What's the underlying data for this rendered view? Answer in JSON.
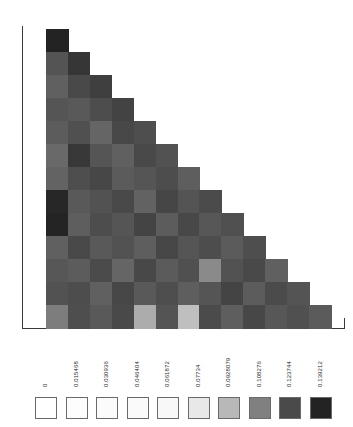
{
  "chart_data": {
    "type": "heatmap",
    "title": "",
    "xlabel": "",
    "ylabel": "",
    "grid": false,
    "shape": "lower-triangular",
    "n_rows": 13,
    "n_cols": 13,
    "legend_position": "bottom",
    "colormap": "grayscale-reversed",
    "value_min": 0,
    "value_max": 0.139212,
    "legend": {
      "labels": [
        "0",
        "0.015468",
        "0.030936",
        "0.046404",
        "0.061872",
        "0.07734",
        "0.0928079",
        "0.108276",
        "0.123744",
        "0.139212"
      ],
      "values": [
        0,
        0.015468,
        0.030936,
        0.046404,
        0.061872,
        0.07734,
        0.0928079,
        0.108276,
        0.123744,
        0.139212
      ],
      "colors": [
        "#ffffff",
        "#fdfdfd",
        "#fbfbfb",
        "#fafafa",
        "#f8f8f8",
        "#e8e8e8",
        "#b8b8b8",
        "#808080",
        "#4a4a4a",
        "#232323"
      ]
    },
    "rows": [
      {
        "row": 0,
        "values": [
          0.1393
        ]
      },
      {
        "row": 1,
        "values": [
          0.121,
          0.1315
        ]
      },
      {
        "row": 2,
        "values": [
          0.1175,
          0.124,
          0.128
        ]
      },
      {
        "row": 3,
        "values": [
          0.1205,
          0.1195,
          0.123,
          0.1265
        ]
      },
      {
        "row": 4,
        "values": [
          0.1185,
          0.122,
          0.116,
          0.1245,
          0.1225
        ]
      },
      {
        "row": 5,
        "values": [
          0.115,
          0.131,
          0.1205,
          0.1175,
          0.124,
          0.1215
        ]
      },
      {
        "row": 6,
        "values": [
          0.1165,
          0.1225,
          0.125,
          0.119,
          0.1205,
          0.123,
          0.118
        ]
      },
      {
        "row": 7,
        "values": [
          0.1375,
          0.1195,
          0.1215,
          0.124,
          0.117,
          0.1255,
          0.121,
          0.1235
        ]
      },
      {
        "row": 8,
        "values": [
          0.1388,
          0.118,
          0.123,
          0.1205,
          0.126,
          0.1185,
          0.1245,
          0.12,
          0.122
        ]
      },
      {
        "row": 9,
        "values": [
          0.1175,
          0.124,
          0.1195,
          0.1215,
          0.118,
          0.125,
          0.1205,
          0.123,
          0.119,
          0.1225
        ]
      },
      {
        "row": 10,
        "values": [
          0.12,
          0.1185,
          0.1235,
          0.116,
          0.1245,
          0.119,
          0.122,
          0.1055,
          0.1215,
          0.124,
          0.1175
        ]
      },
      {
        "row": 11,
        "values": [
          0.1215,
          0.123,
          0.1175,
          0.125,
          0.1195,
          0.1225,
          0.118,
          0.1205,
          0.126,
          0.1185,
          0.1235,
          0.121
        ]
      },
      {
        "row": 12,
        "values": [
          0.109,
          0.1225,
          0.1195,
          0.124,
          0.096,
          0.121,
          0.0905,
          0.1235,
          0.118,
          0.125,
          0.12,
          0.122,
          0.119
        ]
      }
    ]
  }
}
